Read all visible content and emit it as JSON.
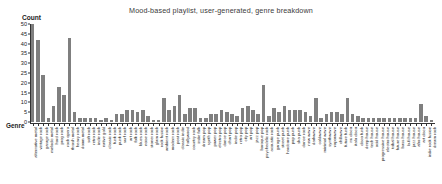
{
  "chart_data": {
    "type": "bar",
    "title": "Mood-based playlist, user-generated, genre breakdown",
    "xlabel": "Genre",
    "ylabel": "Count",
    "ylim": [
      0,
      50
    ],
    "yticks": [
      0,
      5,
      10,
      15,
      20,
      25,
      30,
      35,
      40,
      45,
      50
    ],
    "grid": false,
    "legend": null,
    "bar_color": "#7f7f7f",
    "categories": [
      "alternative metal",
      "vintage rock",
      "garage rock",
      "melodic metal",
      "hard rock",
      "prog rock",
      "rock opera",
      "thrash metal",
      "heavy rock",
      "doom metal",
      "soft rock",
      "retro rock",
      "indie rock",
      "native gold",
      "classic rock",
      "funk rock",
      "punk rock",
      "surf rock",
      "art rock",
      "folk rock",
      "blues rock",
      "noise rock",
      "stoner rock",
      "glam rock",
      "rock fusion",
      "ambient rock",
      "modern rock",
      "post rock",
      "classic indie",
      "hollywood",
      "country rock",
      "indie folk",
      "dream pop",
      "synth pop",
      "power pop",
      "electro pop",
      "dance pop",
      "chart pop",
      "indie pop",
      "retro pop",
      "city pop",
      "art pop",
      "jazz pop",
      "baroque pop",
      "psychedelic rock",
      "acoustic rock",
      "garage punk",
      "street punk",
      "hardcore punk",
      "pop punk",
      "ska punk",
      "dance rock",
      "new wave",
      "darkwave",
      "coldwave",
      "minimal wave",
      "synthwave",
      "vaporwave",
      "chillwave",
      "future funk",
      "nu disco",
      "italo disco",
      "disco funk",
      "deep house",
      "tech house",
      "acid house",
      "progressive house",
      "electro house",
      "tribal house",
      "future house",
      "bass house",
      "lo-fi house",
      "jazz house",
      "afro house",
      "art disco",
      "indie rock fusion",
      "dream rock"
    ],
    "values": [
      50,
      42,
      24,
      2,
      8,
      18,
      14,
      43,
      5,
      2,
      2,
      2,
      2,
      1,
      2,
      1,
      4,
      4,
      6,
      6,
      5,
      6,
      3,
      1,
      1,
      12,
      6,
      8,
      14,
      4,
      7,
      7,
      2,
      2,
      4,
      4,
      6,
      5,
      4,
      3,
      7,
      8,
      6,
      4,
      19,
      3,
      7,
      5,
      8,
      6,
      6,
      6,
      5,
      3,
      12,
      2,
      4,
      5,
      5,
      4,
      12,
      4,
      3,
      2,
      2,
      2,
      2,
      2,
      2,
      2,
      2,
      2,
      2,
      2,
      9,
      3,
      1
    ]
  }
}
